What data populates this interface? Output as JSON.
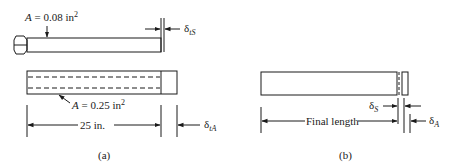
{
  "figure_a": {
    "caption": "(a)",
    "steel_bolt": {
      "area_label": "A = 0.08 in",
      "area_exp": "2",
      "delta_label": "δ",
      "delta_sub": "tS"
    },
    "aluminum_tube": {
      "area_label": "A = 0.25 in",
      "area_exp": "2",
      "delta_label": "δ",
      "delta_sub": "tA"
    },
    "length_label": "25 in."
  },
  "figure_b": {
    "caption": "(b)",
    "length_label": "Final length",
    "delta_s_label": "δ",
    "delta_s_sub": "S",
    "delta_a_label": "δ",
    "delta_a_sub": "A"
  },
  "colors": {
    "ink": "#1a1a1a",
    "background": "#ffffff"
  }
}
